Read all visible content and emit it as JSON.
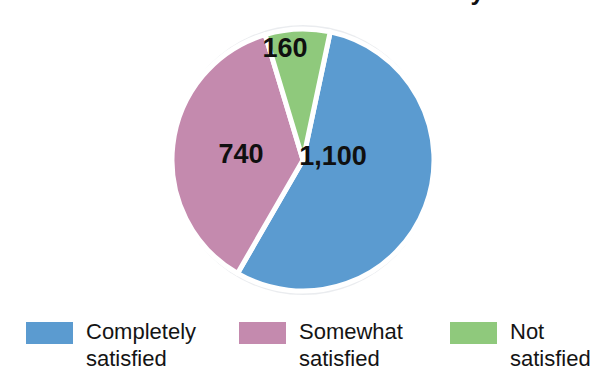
{
  "chart_data": {
    "type": "pie",
    "title": "Customer Satisfaction Survey",
    "title_visible_fragment": "Customer Satisfaction Survey",
    "categories": [
      "Completely satisfied",
      "Somewhat satisfied",
      "Not satisfied"
    ],
    "values": [
      1100,
      740,
      160
    ],
    "value_labels": [
      "1,100",
      "740",
      "160"
    ],
    "total": 2000,
    "percentages": [
      55,
      37,
      8
    ],
    "colors": [
      "#5B9BD0",
      "#C48AAE",
      "#8FC97C"
    ],
    "legend_position": "bottom",
    "grid": false,
    "start_angle_deg": 12,
    "slice_angles_deg": [
      198,
      133.2,
      28.8
    ],
    "xlabel": "",
    "ylabel": ""
  },
  "chart": {
    "title": "Customer Satisfaction Survey",
    "slices": [
      {
        "name": "completely-satisfied",
        "label": "1,100",
        "legend_line1": "Completely",
        "legend_line2": "satisfied",
        "legend_full": "Completely satisfied",
        "value": 1100,
        "color": "#5B9BD0",
        "label_x": 178,
        "label_y": 150
      },
      {
        "name": "somewhat-satisfied",
        "label": "740",
        "legend_line1": "Somewhat",
        "legend_line2": "satisfied",
        "legend_full": "Somewhat satisfied",
        "value": 740,
        "color": "#C48AAE",
        "label_x": 86,
        "label_y": 148
      },
      {
        "name": "not-satisfied",
        "label": "160",
        "legend_line1": "Not",
        "legend_line2": "satisfied",
        "legend_full": "Not satisfied",
        "value": 160,
        "color": "#8FC97C",
        "label_x": 130,
        "label_y": 42
      }
    ]
  },
  "legend": {
    "items": [
      {
        "text": "Completely\nsatisfied",
        "color": "#5B9BD0"
      },
      {
        "text": "Somewhat\nsatisfied",
        "color": "#C48AAE"
      },
      {
        "text": "Not\nsatisfied",
        "color": "#8FC97C"
      }
    ]
  }
}
